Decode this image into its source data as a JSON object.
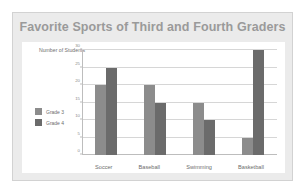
{
  "chart_data": {
    "type": "bar",
    "title": "Favorite Sports of Third and Fourth Graders",
    "xlabel": "",
    "ylabel": "Number of Students",
    "categories": [
      "Soccer",
      "Baseball",
      "Swimming",
      "Basketball"
    ],
    "series": [
      {
        "name": "Grade 3",
        "color": "#8c8c8c",
        "values": [
          20,
          20,
          15,
          5
        ]
      },
      {
        "name": "Grade 4",
        "color": "#6b6b6b",
        "values": [
          25,
          15,
          10,
          30
        ]
      }
    ],
    "ylim": [
      0,
      30
    ],
    "yticks": [
      0,
      5,
      10,
      15,
      20,
      25,
      30
    ],
    "ytick_labels": [
      "0",
      "5",
      "10",
      "15",
      "20",
      "25",
      "30"
    ],
    "grid": true,
    "legend_position": "left"
  },
  "card": {
    "background": "#ebebeb",
    "panel_background": "#ffffff",
    "title_color": "#9a9a9a",
    "grid_color": "#d6d6d6"
  }
}
